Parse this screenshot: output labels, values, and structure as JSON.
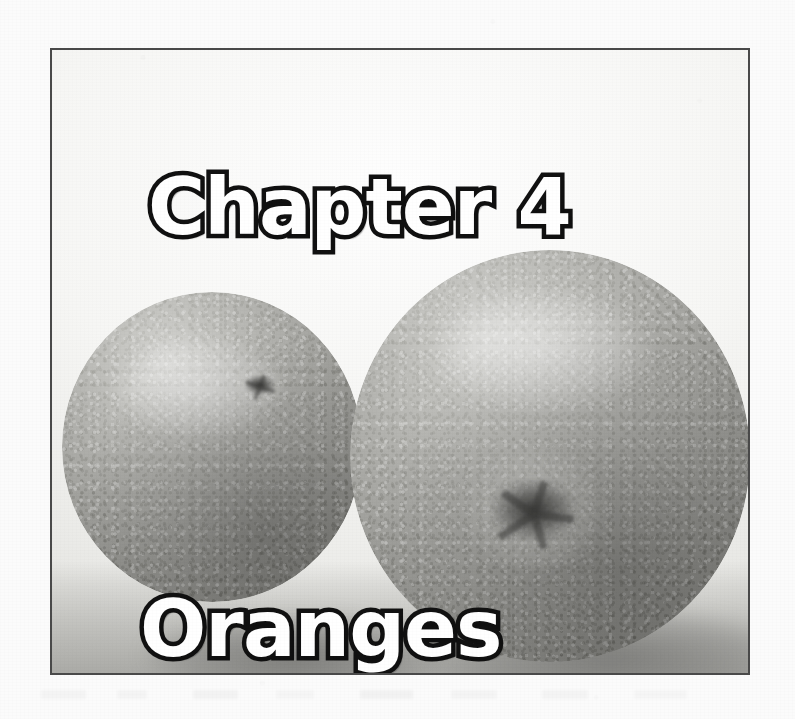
{
  "page": {
    "kind": "scanned-book-page",
    "background_color": "#fbfbfb",
    "width": 795,
    "height": 719
  },
  "figure": {
    "frame": {
      "border_color": "#4a4a4a",
      "border_width": 2,
      "x": 50,
      "y": 48,
      "width": 700,
      "height": 627
    },
    "photo": {
      "description": "grayscale photograph of two oranges on a light surface",
      "rendering": "black-and-white halftone scan",
      "subject_count": 2,
      "backdrop_color": "#f6f6f4",
      "surface_color": "#ababa7"
    },
    "subjects": [
      {
        "name": "orange-left",
        "position": "left",
        "relative_size": "smaller",
        "feature": "stem-scar"
      },
      {
        "name": "orange-right",
        "position": "right",
        "relative_size": "larger",
        "feature": "star-shaped-calyx-scar"
      }
    ]
  },
  "titles": {
    "chapter_label": "Chapter 4",
    "subject_label": "Oranges",
    "fill_color": "#ffffff",
    "outline_color": "#111111"
  }
}
